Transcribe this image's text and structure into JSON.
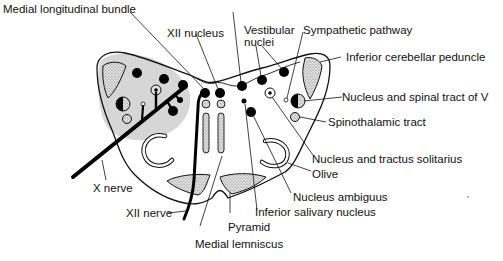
{
  "diagram": {
    "type": "anatomical-cross-section",
    "colors": {
      "outline": "#111111",
      "shaded_region": "#d4d4d4",
      "stipple_fill": "#bdbdbd",
      "nucleus_fill": "#000000",
      "background": "#ffffff"
    },
    "labels": {
      "medial_longitudinal_bundle": "Medial longitudinal bundle",
      "xii_nucleus": "XII nucleus",
      "vestibular_nuclei_line1": "Vestibular",
      "vestibular_nuclei_line2": "nuclei",
      "sympathetic_pathway": "Sympathetic pathway",
      "inferior_cerebellar_peduncle": "Inferior cerebellar peduncle",
      "nucleus_spinal_tract_v": "Nucleus and spinal tract of V",
      "spinothalamic_tract": "Spinothalamic tract",
      "nucleus_tractus_solitarius": "Nucleus and tractus solitarius",
      "olive": "Olive",
      "nucleus_ambiguus": "Nucleus ambiguus",
      "inferior_salivary_nucleus": "Inferior salivary nucleus",
      "pyramid": "Pyramid",
      "medial_lemniscus": "Medial lemniscus",
      "x_nerve": "X nerve",
      "xii_nerve": "XII nerve"
    }
  }
}
